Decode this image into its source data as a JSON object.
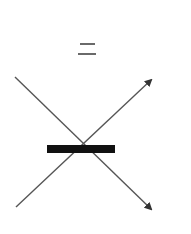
{
  "diagram": {
    "type": "symbol-diagram",
    "symbols": [
      {
        "name": "equals-sign",
        "glyph": "=",
        "position": "top-center"
      },
      {
        "name": "crossing-arrows",
        "description": "two diagonal lines crossing in an X, each ending in an arrowhead on the right side"
      },
      {
        "name": "black-bar",
        "description": "thick horizontal black bar over the crossing point"
      }
    ],
    "colors": {
      "background": "#ffffff",
      "line": "#555555",
      "equals": "#6a6a6a",
      "bar": "#111111"
    },
    "geometry": {
      "equals_top": {
        "x": 80,
        "y": 43,
        "w": 15
      },
      "equals_bottom": {
        "x": 78,
        "y": 53,
        "w": 18
      },
      "line_down": {
        "x1": 15,
        "y1": 77,
        "x2": 151,
        "y2": 209
      },
      "line_up": {
        "x1": 16,
        "y1": 207,
        "x2": 151,
        "y2": 80
      },
      "bar": {
        "x": 47,
        "y": 145,
        "w": 68,
        "h": 8
      }
    }
  }
}
